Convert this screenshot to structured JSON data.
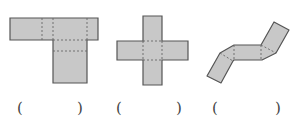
{
  "figures": [
    {
      "id": "net-1",
      "shape": "t-shaped-net",
      "answer_blank": {
        "open": "(",
        "close": ")"
      }
    },
    {
      "id": "net-2",
      "shape": "cross-shaped-net",
      "answer_blank": {
        "open": "(",
        "close": ")"
      }
    },
    {
      "id": "net-3",
      "shape": "zigzag-folded-net",
      "answer_blank": {
        "open": "(",
        "close": ")"
      }
    }
  ],
  "colors": {
    "fill": "#c8c8c8",
    "stroke": "#555555",
    "fold_line": "#666666",
    "text": "#444444"
  }
}
